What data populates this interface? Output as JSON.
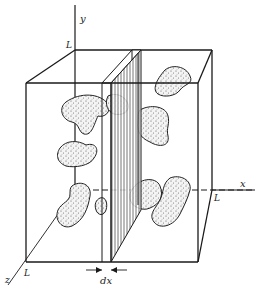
{
  "figure": {
    "axes": {
      "x_label": "x",
      "y_label": "y",
      "z_label": "z"
    },
    "corner_labels": {
      "top": "L",
      "right": "L",
      "bottom": "L"
    },
    "slab_label": "dx",
    "colors": {
      "ink": "#1a1a1a",
      "paper": "#ffffff",
      "stipple": "#555555"
    }
  }
}
